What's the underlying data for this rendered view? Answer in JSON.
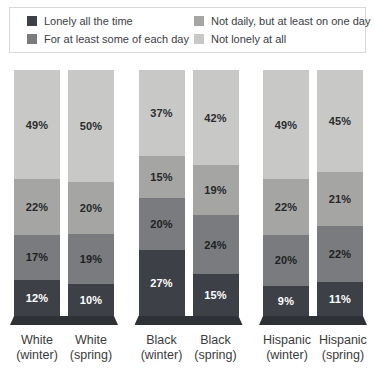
{
  "legend": {
    "items": [
      {
        "label": "Lonely all the time",
        "color": "#3d4147"
      },
      {
        "label": "Not daily, but at least on one day",
        "color": "#a5a5a3"
      },
      {
        "label": "For at least some of each day",
        "color": "#797b7e"
      },
      {
        "label": "Not lonely at all",
        "color": "#c8c8c6"
      }
    ]
  },
  "chart_data": {
    "type": "bar",
    "stacked": true,
    "unit": "%",
    "legend_position": "top",
    "segments_top_to_bottom": [
      "Not lonely at all",
      "Not daily, but at least on one day",
      "For at least some of each day",
      "Lonely all the time"
    ],
    "segment_colors_top_to_bottom": [
      "#c8c8c6",
      "#a5a5a3",
      "#797b7e",
      "#3d4147"
    ],
    "segment_text_colors_top_to_bottom": [
      "#2b2d30",
      "#26282b",
      "#1d1f22",
      "#ffffff"
    ],
    "pedestal_color": "#2e3237",
    "groups": [
      {
        "category": "White",
        "bars": [
          {
            "label_line1": "White",
            "label_line2": "(winter)",
            "values_top_to_bottom": [
              49,
              22,
              17,
              12
            ]
          },
          {
            "label_line1": "White",
            "label_line2": "(spring)",
            "values_top_to_bottom": [
              50,
              20,
              19,
              10
            ]
          }
        ]
      },
      {
        "category": "Black",
        "bars": [
          {
            "label_line1": "Black",
            "label_line2": "(winter)",
            "values_top_to_bottom": [
              37,
              15,
              20,
              27
            ]
          },
          {
            "label_line1": "Black",
            "label_line2": "(spring)",
            "values_top_to_bottom": [
              42,
              19,
              24,
              15
            ]
          }
        ]
      },
      {
        "category": "Hispanic",
        "bars": [
          {
            "label_line1": "Hispanic",
            "label_line2": "(winter)",
            "values_top_to_bottom": [
              49,
              22,
              20,
              9
            ]
          },
          {
            "label_line1": "Hispanic",
            "label_line2": "(spring)",
            "values_top_to_bottom": [
              45,
              21,
              22,
              11
            ]
          }
        ]
      }
    ]
  }
}
